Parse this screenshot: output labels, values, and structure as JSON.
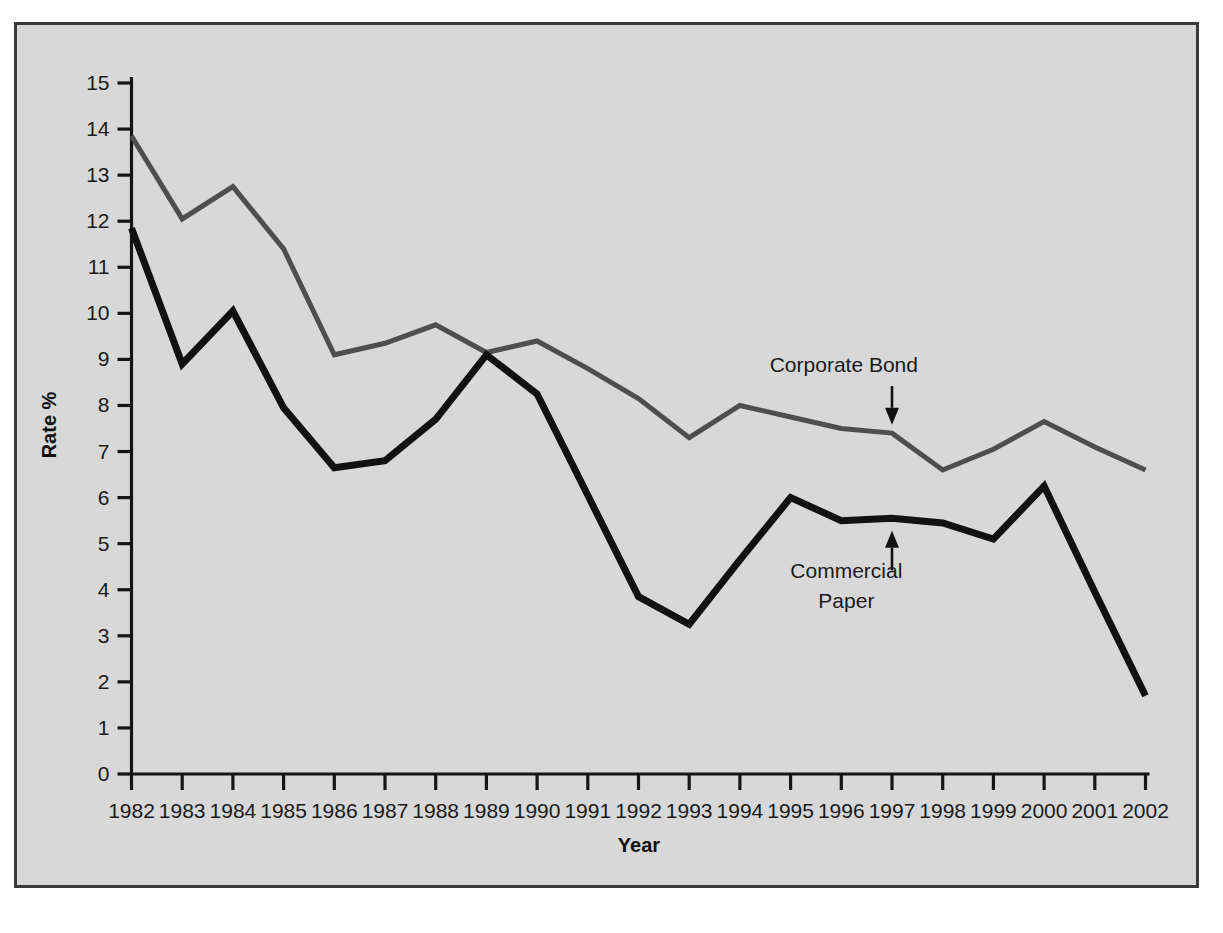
{
  "figure": {
    "panel_background": "#d8d8d8",
    "panel_border_color": "#3a3a3a",
    "page_background": "#ffffff"
  },
  "chart_data": {
    "type": "line",
    "title": "",
    "subtitle": "",
    "xlabel": "Year",
    "ylabel": "Rate %",
    "xlim": [
      1982,
      2002
    ],
    "ylim": [
      0,
      15
    ],
    "ytick_step": 1,
    "grid": false,
    "legend_position": "inline-annotations",
    "categories": [
      "1982",
      "1983",
      "1984",
      "1985",
      "1986",
      "1987",
      "1988",
      "1989",
      "1990",
      "1991",
      "1992",
      "1993",
      "1994",
      "1995",
      "1996",
      "1997",
      "1998",
      "1999",
      "2000",
      "2001",
      "2002"
    ],
    "x": [
      1982,
      1983,
      1984,
      1985,
      1986,
      1987,
      1988,
      1989,
      1990,
      1991,
      1992,
      1993,
      1994,
      1995,
      1996,
      1997,
      1998,
      1999,
      2000,
      2001,
      2002
    ],
    "yticks": [
      0,
      1,
      2,
      3,
      4,
      5,
      6,
      7,
      8,
      9,
      10,
      11,
      12,
      13,
      14,
      15
    ],
    "ytick_labels": [
      "0",
      "1",
      "2",
      "3",
      "4",
      "5",
      "6",
      "7",
      "8",
      "9",
      "10",
      "11",
      "12",
      "13",
      "14",
      "15"
    ],
    "series": [
      {
        "name": "Corporate Bond",
        "color": "#4e4e4e",
        "stroke_width": 5.0,
        "values": [
          13.85,
          12.05,
          12.75,
          11.4,
          9.1,
          9.35,
          9.75,
          9.15,
          9.4,
          8.8,
          8.15,
          7.3,
          8.0,
          7.75,
          7.5,
          7.4,
          6.6,
          7.05,
          7.65,
          7.1,
          6.6
        ]
      },
      {
        "name": "Commercial Paper",
        "color": "#111111",
        "stroke_width": 7.0,
        "values": [
          11.85,
          8.9,
          10.05,
          7.95,
          6.65,
          6.8,
          7.7,
          9.1,
          8.25,
          6.05,
          3.85,
          3.25,
          4.65,
          6.0,
          5.5,
          5.55,
          5.45,
          5.1,
          6.25,
          3.95,
          1.7
        ]
      }
    ],
    "annotations": [
      {
        "name": "corporate-bond-annotation",
        "text": "Corporate Bond",
        "lines": [
          "Corporate Bond"
        ],
        "label_x": 1996.05,
        "label_y": 8.72,
        "arrow_x": 1997.0,
        "arrow_from_y": 8.42,
        "arrow_to_y": 7.58,
        "direction": "down"
      },
      {
        "name": "commercial-paper-annotation",
        "text": "Commercial Paper",
        "lines": [
          "Commercial",
          "Paper"
        ],
        "label_x": 1996.1,
        "label_y": 4.25,
        "arrow_x": 1997.0,
        "arrow_from_y": 4.42,
        "arrow_to_y": 5.28,
        "direction": "up"
      }
    ]
  }
}
